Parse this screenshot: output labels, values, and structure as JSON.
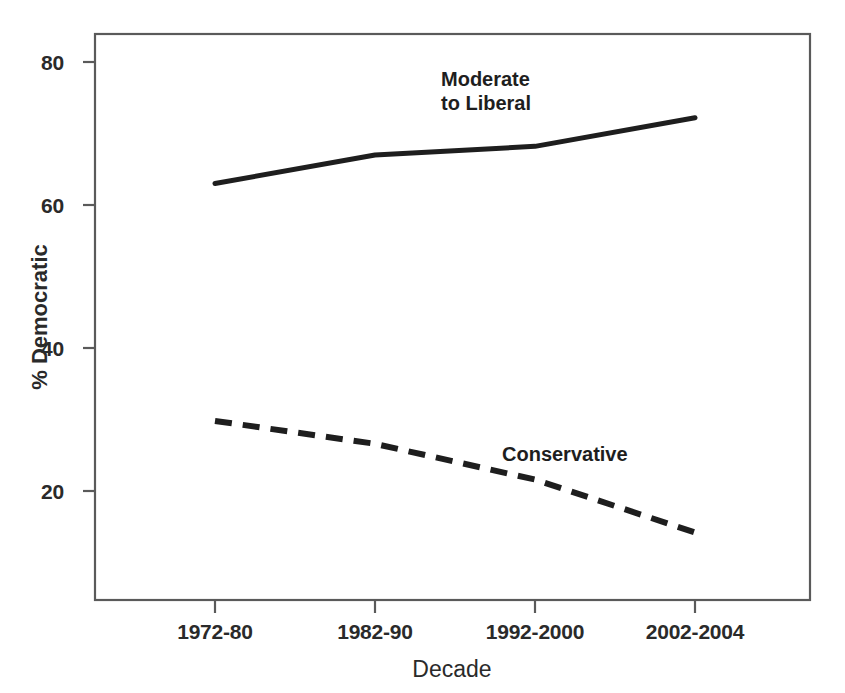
{
  "chart_data": {
    "type": "line",
    "title": "",
    "xlabel": "Decade",
    "ylabel": "% Democratic",
    "categories": [
      "1972-80",
      "1982-90",
      "1992-2000",
      "2002-2004"
    ],
    "ylim": [
      10,
      84
    ],
    "yticks": [
      20,
      40,
      60,
      80
    ],
    "ytick_labels": [
      "20",
      "40",
      "60",
      "80"
    ],
    "grid": false,
    "legend_position": "inline-annotations",
    "series": [
      {
        "name": "Moderate to Liberal",
        "style": "solid",
        "color": "#1e1e1e",
        "values": [
          63,
          67,
          68.2,
          72.2
        ]
      },
      {
        "name": "Conservative",
        "style": "dashed",
        "color": "#1e1e1e",
        "values": [
          29.8,
          26.6,
          21.6,
          14.2
        ]
      }
    ],
    "annotations": [
      {
        "text_line1": "Moderate",
        "text_line2": "to Liberal",
        "series": "Moderate to Liberal"
      },
      {
        "text_line1": "Conservative",
        "text_line2": "",
        "series": "Conservative"
      }
    ]
  },
  "axes": {
    "y_tick_0": "20",
    "y_tick_1": "40",
    "y_tick_2": "60",
    "y_tick_3": "80",
    "x_tick_0": "1972-80",
    "x_tick_1": "1982-90",
    "x_tick_2": "1992-2000",
    "x_tick_3": "2002-2004",
    "x_title": "Decade",
    "y_title": "% Democratic"
  },
  "labels": {
    "moderate_line1": "Moderate",
    "moderate_line2": "to Liberal",
    "conservative": "Conservative"
  }
}
